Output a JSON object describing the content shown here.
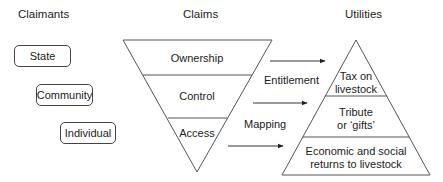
{
  "columns": {
    "claimants": "Claimants",
    "claims": "Claims",
    "utilities": "Utilities"
  },
  "claimants": [
    "State",
    "Community",
    "Individual"
  ],
  "claims": [
    "Ownership",
    "Control",
    "Access"
  ],
  "utilities": [
    "Tax on livestock",
    "Tribute or ‘gifts’",
    "Economic and social returns to livestock"
  ],
  "utilities_lines": [
    [
      "Tax on",
      "livestock"
    ],
    [
      "Tribute",
      "or ‘gifts’"
    ],
    [
      "Economic and social",
      "returns to livestock"
    ]
  ],
  "relations": {
    "entitlement": "Entitlement",
    "mapping": "Mapping"
  },
  "colors": {
    "line": "#444444",
    "text": "#222222",
    "background": "#ffffff"
  }
}
